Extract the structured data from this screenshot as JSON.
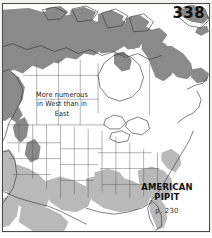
{
  "plate": {
    "page_number": "338",
    "species_name_line1": "AMERICAN",
    "species_name_line2": "PIPIT",
    "page_reference": "p. 230"
  },
  "annotation": {
    "line1": "More numerous",
    "line2": "in West than in",
    "line3": "East"
  },
  "legend_colors": {
    "breeding_range": "#8a8a8a",
    "winter_range": "#b9b9b9",
    "land_absent": "#fdfdfc",
    "coastline": "#3a3a3a",
    "border": "#4a4a4a",
    "water": "#ffffff"
  },
  "map": {
    "region": "North America",
    "projection_note": "conic",
    "breeding_areas": [
      "Alaska",
      "Yukon",
      "Northwest Territories",
      "Arctic Archipelago",
      "Nunavut",
      "Hudson Bay coast",
      "Northern Quebec",
      "Labrador",
      "Newfoundland",
      "British Columbia coast",
      "Greenland southwest tip"
    ],
    "winter_areas": [
      "California",
      "Southwest United States",
      "Texas",
      "Gulf Coast",
      "Southeastern United States",
      "Florida",
      "Mexico",
      "Baja California"
    ]
  }
}
